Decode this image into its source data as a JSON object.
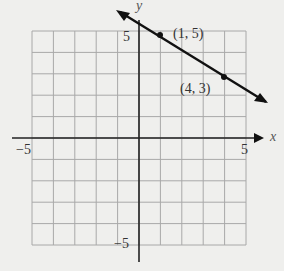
{
  "chart_data": {
    "type": "line",
    "title": "",
    "xlabel": "x",
    "ylabel": "y",
    "xlim": [
      -5,
      5
    ],
    "ylim": [
      -5,
      5
    ],
    "grid": true,
    "tick_labels": {
      "x": [
        "-5",
        "5"
      ],
      "y": [
        "5",
        "-5"
      ]
    },
    "series": [
      {
        "name": "line",
        "x": [
          1,
          4
        ],
        "y": [
          5,
          3
        ],
        "equation": "y = -2/3 x + 17/3",
        "arrows_both_ends": true
      }
    ],
    "points": [
      {
        "x": 1,
        "y": 5,
        "label": "(1, 5)"
      },
      {
        "x": 4,
        "y": 3,
        "label": "(4, 3)"
      }
    ],
    "legend": null
  },
  "labels": {
    "x_axis": "x",
    "y_axis": "y",
    "x_min": "−5",
    "x_max": "5",
    "y_max": "5",
    "y_min": "−5",
    "point1": "(1, 5)",
    "point2": "(4, 3)"
  },
  "colors": {
    "background": "#efefed",
    "grid": "#a8a8a8",
    "axis": "#222222",
    "line": "#111111"
  }
}
